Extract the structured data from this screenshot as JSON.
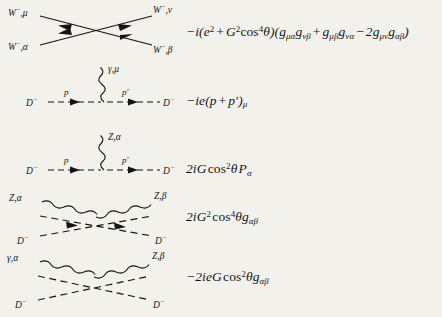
{
  "page": {
    "background_color": "#f3f1ec",
    "ink_color": "#151515"
  },
  "rules": [
    {
      "id": "four-w-vertex",
      "diagram": {
        "type": "four-point-crossed-solid",
        "legs": [
          {
            "position": "top-left",
            "particle": "W",
            "charge": "−",
            "index": "μ",
            "label": "W⁻,μ",
            "arrow": "inward"
          },
          {
            "position": "top-right",
            "particle": "W",
            "charge": "−",
            "index": "ν",
            "label": "W⁻,ν",
            "arrow": "inward"
          },
          {
            "position": "bottom-left",
            "particle": "W",
            "charge": "−",
            "index": "α",
            "label": "W⁻,α",
            "arrow": "inward"
          },
          {
            "position": "bottom-right",
            "particle": "W",
            "charge": "−",
            "index": "β",
            "label": "W⁻,β",
            "arrow": "inward"
          }
        ]
      },
      "expression_text": "−i(e² + G²cos⁴θ)(gμα gνβ + gμβ gνα − 2gμν gαβ)"
    },
    {
      "id": "photon-d-d-vertex",
      "diagram": {
        "type": "three-point-wavy-up",
        "boson": {
          "particle": "γ",
          "index": "μ",
          "label": "γ,μ",
          "line": "wavy"
        },
        "legs": [
          {
            "position": "left",
            "particle": "D",
            "charge": "−",
            "label": "D⁻",
            "line": "dashed",
            "momentum": "p",
            "arrow": "right"
          },
          {
            "position": "right",
            "particle": "D",
            "charge": "−",
            "label": "D⁻",
            "line": "dashed",
            "momentum": "p′",
            "arrow": "right"
          }
        ]
      },
      "expression_text": "−ie(p + p′)μ"
    },
    {
      "id": "z-d-d-vertex",
      "diagram": {
        "type": "three-point-wavy-up",
        "boson": {
          "particle": "Z",
          "index": "α",
          "label": "Z,α",
          "line": "wavy"
        },
        "legs": [
          {
            "position": "left",
            "particle": "D",
            "charge": "−",
            "label": "D⁻",
            "line": "dashed",
            "momentum": "p",
            "arrow": "right"
          },
          {
            "position": "right",
            "particle": "D",
            "charge": "−",
            "label": "D⁻",
            "line": "dashed",
            "momentum": "p′",
            "arrow": "right"
          }
        ]
      },
      "expression_text": "2iG cos²θ Pα"
    },
    {
      "id": "zz-dd-vertex",
      "diagram": {
        "type": "four-point-crossed-wavy-dashed",
        "legs": [
          {
            "position": "top-left",
            "particle": "Z",
            "index": "α",
            "label": "Z,α",
            "line": "wavy"
          },
          {
            "position": "top-right",
            "particle": "Z",
            "index": "β",
            "label": "Z,β",
            "line": "wavy"
          },
          {
            "position": "bottom-left",
            "particle": "D",
            "charge": "−",
            "label": "D⁻",
            "line": "dashed",
            "arrow": "inward"
          },
          {
            "position": "bottom-right",
            "particle": "D",
            "charge": "−",
            "label": "D⁻",
            "line": "dashed",
            "arrow": "inward"
          }
        ]
      },
      "expression_text": "2iG² cos⁴θ gαβ"
    },
    {
      "id": "gamma-z-dd-vertex",
      "diagram": {
        "type": "four-point-crossed-wavy-dashed",
        "legs": [
          {
            "position": "top-left",
            "particle": "γ",
            "index": "α",
            "label": "γ,α",
            "line": "wavy"
          },
          {
            "position": "top-right",
            "particle": "Z",
            "index": "β",
            "label": "Z,β",
            "line": "wavy"
          },
          {
            "position": "bottom-left",
            "particle": "D",
            "charge": "−",
            "label": "D⁻",
            "line": "dashed"
          },
          {
            "position": "bottom-right",
            "particle": "D",
            "charge": "−",
            "label": "D⁻",
            "line": "dashed"
          }
        ]
      },
      "expression_text": "−2ieG cos²θ gαβ"
    }
  ],
  "labels": {
    "W_minus": "W",
    "D_minus": "D",
    "Z": "Z",
    "gamma": "γ",
    "minus_sup": "−",
    "mu": "μ",
    "nu": "ν",
    "alpha": "α",
    "beta": "β",
    "p": "p",
    "p_prime": "p′"
  }
}
